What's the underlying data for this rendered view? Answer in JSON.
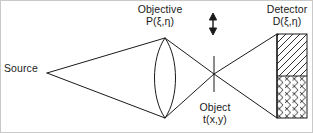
{
  "figure": {
    "type": "optical-imaging-schematic",
    "width": 313,
    "height": 133,
    "stroke_color": "#1a1a1a",
    "background_color": "#ffffff"
  },
  "labels": {
    "source": {
      "line1": "Source"
    },
    "objective": {
      "line1": "Objective",
      "line2": "P(ξ,η)"
    },
    "object": {
      "line1": "Object",
      "line2": "t(x,y)"
    },
    "detector": {
      "line1": "Detector",
      "line2": "D(ξ,η)"
    }
  },
  "elements": {
    "source_point": {
      "x": 47,
      "y": 73
    },
    "lens": {
      "center_x": 165,
      "top_y": 38,
      "bottom_y": 118,
      "half_width": 12
    },
    "object_plane": {
      "x": 214,
      "top_y": 56,
      "bottom_y": 92
    },
    "scan_arrow": {
      "x": 213,
      "top_y": 15,
      "bottom_y": 33,
      "heads": "both"
    },
    "detector_panel": {
      "left_x": 277,
      "right_x": 307,
      "top_y": 34,
      "bottom_y": 118,
      "split_y": 76,
      "upper_fill": "diagonal-hatch",
      "lower_fill": "cross-hatch"
    }
  }
}
